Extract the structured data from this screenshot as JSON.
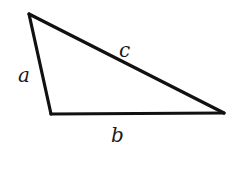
{
  "diagram": {
    "type": "triangle",
    "stroke_color": "#111111",
    "background": "#ffffff",
    "vertices": {
      "top": [
        29,
        14
      ],
      "bottom_left": [
        51,
        114
      ],
      "bottom_right": [
        224,
        113
      ]
    },
    "labels": {
      "a": "a",
      "b": "b",
      "c": "c"
    }
  }
}
